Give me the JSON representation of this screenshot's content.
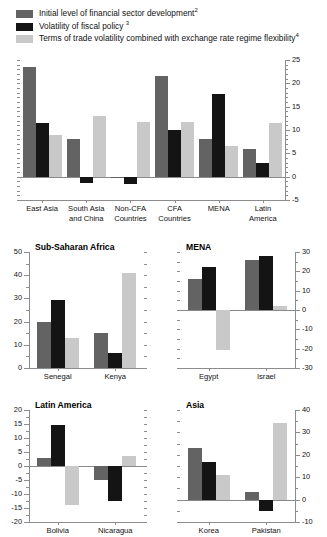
{
  "legend": {
    "items": [
      {
        "label": "Initial level of financial sector development",
        "note": "2",
        "color": "#636363",
        "icon": "legend-swatch"
      },
      {
        "label": "Volatility of fiscal policy ",
        "note": "3",
        "color": "#141414",
        "icon": "legend-swatch"
      },
      {
        "label": "Terms of trade volatility combined with exchange rate regime flexibility",
        "note": "4",
        "color": "#c9c9c9",
        "icon": "legend-swatch"
      }
    ]
  },
  "colors": {
    "series1": "#636363",
    "series2": "#141414",
    "series3": "#c9c9c9",
    "axis": "#8c8c8c",
    "text": "#111111"
  },
  "chart_data": [
    {
      "id": "main",
      "type": "bar",
      "title": "",
      "categories": [
        "East Asia",
        "South Asia and China",
        "Non-CFA Countries",
        "CFA Countries",
        "MENA",
        "Latin America"
      ],
      "series": [
        {
          "name": "Initial level of financial sector development",
          "color": "#636363",
          "values": [
            23.5,
            8.0,
            -0.3,
            21.5,
            8.0,
            6.0
          ]
        },
        {
          "name": "Volatility of fiscal policy",
          "color": "#141414",
          "values": [
            11.5,
            -1.3,
            -1.5,
            10.0,
            17.8,
            3.0
          ]
        },
        {
          "name": "Terms of trade volatility combined with exchange rate regime flexibility",
          "color": "#c9c9c9",
          "values": [
            9.0,
            13.0,
            11.8,
            11.8,
            6.5,
            11.5
          ]
        }
      ],
      "ylim": [
        -5,
        25
      ],
      "yticks": [
        -5,
        0,
        5,
        10,
        15,
        20,
        25
      ],
      "yticklabels": [
        "-5",
        "0",
        "5",
        "10",
        "15",
        "20",
        "25"
      ],
      "minor_tick_step": 1,
      "axis_side": "right",
      "xlabel": "",
      "ylabel": "",
      "grid": false,
      "legend_position": "top-left"
    },
    {
      "id": "ssa",
      "type": "bar",
      "title": "Sub-Saharan Africa",
      "categories": [
        "Senegal",
        "Kenya"
      ],
      "series": [
        {
          "name": "Initial level of financial sector development",
          "color": "#636363",
          "values": [
            20,
            15
          ]
        },
        {
          "name": "Volatility of fiscal policy",
          "color": "#141414",
          "values": [
            29.5,
            6.5
          ]
        },
        {
          "name": "Terms of trade volatility combined with exchange rate regime flexibility",
          "color": "#c9c9c9",
          "values": [
            13,
            41
          ]
        }
      ],
      "ylim": [
        0,
        50
      ],
      "yticks": [
        0,
        10,
        20,
        30,
        40,
        50
      ],
      "yticklabels": [
        "0",
        "10",
        "20",
        "30",
        "40",
        "50"
      ],
      "minor_tick_step": 5,
      "axis_side": "left",
      "grid": false
    },
    {
      "id": "mena",
      "type": "bar",
      "title": "MENA",
      "categories": [
        "Egypt",
        "Israel"
      ],
      "series": [
        {
          "name": "Initial level of financial sector development",
          "color": "#636363",
          "values": [
            16,
            26
          ]
        },
        {
          "name": "Volatility of fiscal policy",
          "color": "#141414",
          "values": [
            22,
            28
          ]
        },
        {
          "name": "Terms of trade volatility combined with exchange rate regime flexibility",
          "color": "#c9c9c9",
          "values": [
            -20.5,
            2
          ]
        }
      ],
      "ylim": [
        -30,
        30
      ],
      "yticks": [
        -30,
        -20,
        -10,
        0,
        10,
        20,
        30
      ],
      "yticklabels": [
        "-30",
        "-20",
        "-10",
        "0",
        "10",
        "20",
        "30"
      ],
      "minor_tick_step": 5,
      "axis_side": "right",
      "grid": false
    },
    {
      "id": "latam",
      "type": "bar",
      "title": "Latin America",
      "categories": [
        "Bolivia",
        "Nicaragua"
      ],
      "series": [
        {
          "name": "Initial level of financial sector development",
          "color": "#636363",
          "values": [
            3,
            -5
          ]
        },
        {
          "name": "Volatility of fiscal policy",
          "color": "#141414",
          "values": [
            14.5,
            -12.5
          ]
        },
        {
          "name": "Terms of trade volatility combined with exchange rate regime flexibility",
          "color": "#c9c9c9",
          "values": [
            -14,
            3.5
          ]
        }
      ],
      "ylim": [
        -20,
        20
      ],
      "yticks": [
        -20,
        -15,
        -10,
        -5,
        0,
        5,
        10,
        15,
        20
      ],
      "yticklabels": [
        "-20",
        "-15",
        "-10",
        "-5",
        "0",
        "5",
        "10",
        "15",
        "20"
      ],
      "minor_tick_step": 2.5,
      "axis_side": "left",
      "grid": false
    },
    {
      "id": "asia",
      "type": "bar",
      "title": "Asia",
      "categories": [
        "Korea",
        "Pakistan"
      ],
      "series": [
        {
          "name": "Initial level of financial sector development",
          "color": "#636363",
          "values": [
            23,
            3.5
          ]
        },
        {
          "name": "Volatility of fiscal policy",
          "color": "#141414",
          "values": [
            17,
            -5
          ]
        },
        {
          "name": "Terms of trade volatility combined with exchange rate regime flexibility",
          "color": "#c9c9c9",
          "values": [
            11,
            34
          ]
        }
      ],
      "ylim": [
        -10,
        40
      ],
      "yticks": [
        -10,
        0,
        10,
        20,
        30,
        40
      ],
      "yticklabels": [
        "-10",
        "0",
        "10",
        "20",
        "30",
        "40"
      ],
      "minor_tick_step": 5,
      "axis_side": "right",
      "grid": false
    }
  ]
}
